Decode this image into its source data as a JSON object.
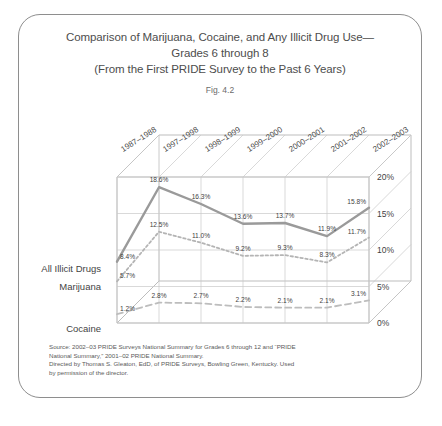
{
  "figure": {
    "title_lines": [
      "Comparison of Marijuana, Cocaine, and Any Illicit Drug Use—",
      "Grades 6 through 8",
      "(From the First PRIDE Survey to the Past 6 Years)"
    ],
    "fig_number": "Fig. 4.2",
    "source_lines": [
      "Source: 2002–03 PRIDE Surveys National Summary for Grades 6 through 12 and “PRIDE",
      "National Summary,” 2001–02 PRIDE National Summary.",
      "Directed by Thomas S. Gleaton, EdD, of PRIDE Surveys, Bowling Green, Kentucky. Used",
      "by permission of the director."
    ]
  },
  "chart_data": {
    "type": "line",
    "xlabel": "",
    "ylabel": "",
    "categories": [
      "1987–1988",
      "1997–1998",
      "1998–1999",
      "1999–2000",
      "2000–2001",
      "2001–2002",
      "2002–2003"
    ],
    "ylim": [
      0,
      20
    ],
    "yticks": [
      0,
      5,
      10,
      15,
      20
    ],
    "ytick_labels": [
      "0%",
      "5%",
      "10%",
      "15%",
      "20%"
    ],
    "grid": true,
    "legend_position": "left-inline-labels",
    "series": [
      {
        "name": "All Illicit Drugs",
        "color": "#9a9a9a",
        "dash": "solid",
        "values": [
          8.4,
          18.6,
          16.3,
          13.6,
          13.7,
          11.9,
          15.8
        ],
        "labels": [
          "8.4%",
          "18.6%",
          "16.3%",
          "13.6%",
          "13.7%",
          "11.9%",
          "15.8%"
        ]
      },
      {
        "name": "Marijuana",
        "color": "#b4b4b4",
        "dash": "dotted",
        "values": [
          5.7,
          12.5,
          11.0,
          9.2,
          9.3,
          8.3,
          11.7
        ],
        "labels": [
          "5.7%",
          "12.5%",
          "11.0%",
          "9.2%",
          "9.3%",
          "8.3%",
          "11.7%"
        ]
      },
      {
        "name": "Cocaine",
        "color": "#bdbdbd",
        "dash": "dashed",
        "values": [
          1.2,
          2.8,
          2.7,
          2.2,
          2.1,
          2.1,
          3.1
        ],
        "labels": [
          "1.2%",
          "2.8%",
          "2.7%",
          "2.2%",
          "2.1%",
          "2.1%",
          "3.1%"
        ]
      }
    ]
  }
}
